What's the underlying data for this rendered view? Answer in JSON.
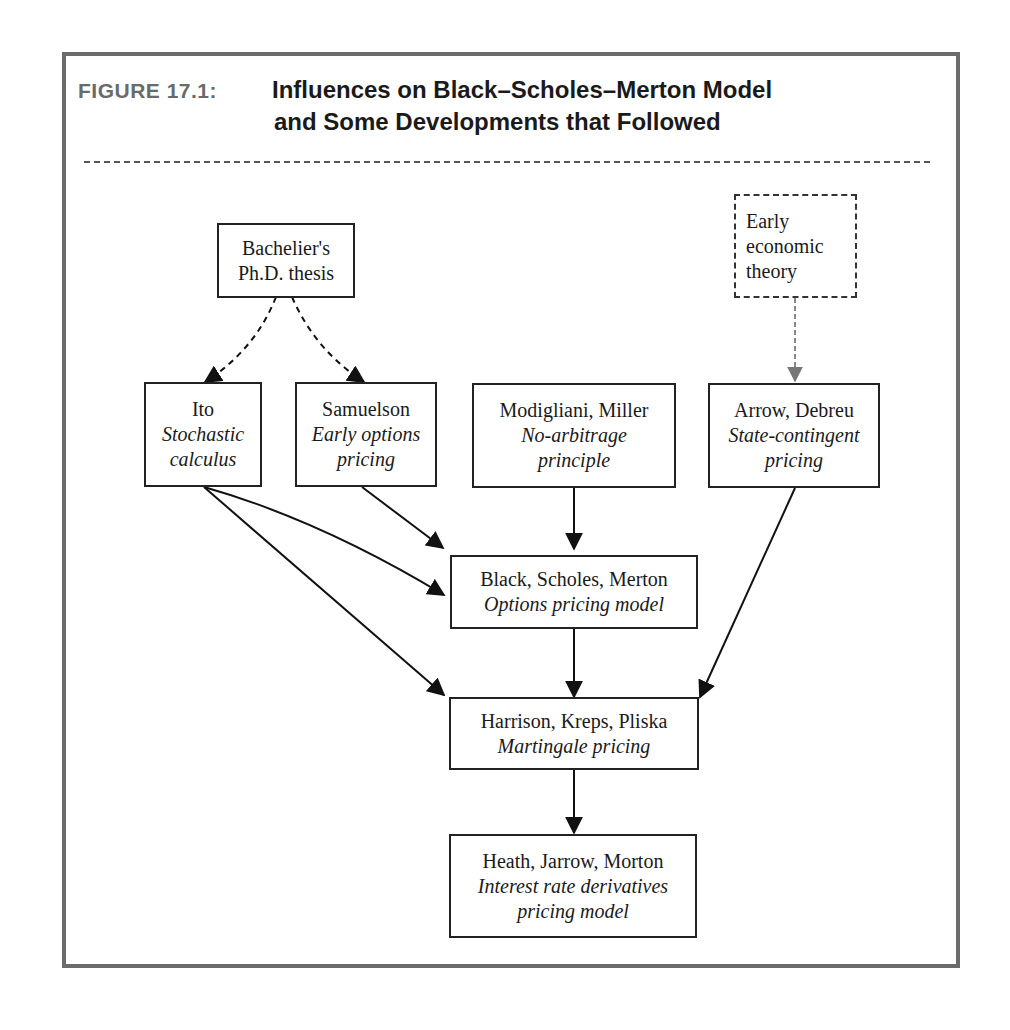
{
  "figure": {
    "label": "FIGURE 17.1:",
    "title_line1": "Influences on Black–Scholes–Merton Model",
    "title_line2": "and Some Developments that Followed"
  },
  "nodes": {
    "bachelier": {
      "name": "Bachelier's",
      "sub": "Ph.D. thesis"
    },
    "early_econ": {
      "line1": "Early",
      "line2": "economic",
      "line3": "theory"
    },
    "ito": {
      "name": "Ito",
      "sub1": "Stochastic",
      "sub2": "calculus"
    },
    "samuelson": {
      "name": "Samuelson",
      "sub1": "Early options",
      "sub2": "pricing"
    },
    "modigliani": {
      "name": "Modigliani, Miller",
      "sub1": "No-arbitrage",
      "sub2": "principle"
    },
    "arrow": {
      "name": "Arrow, Debreu",
      "sub1": "State-contingent",
      "sub2": "pricing"
    },
    "bsm": {
      "name": "Black, Scholes, Merton",
      "sub": "Options pricing model"
    },
    "hkp": {
      "name": "Harrison, Kreps, Pliska",
      "sub": "Martingale pricing"
    },
    "hjm": {
      "name": "Heath, Jarrow, Morton",
      "sub1": "Interest rate derivatives",
      "sub2": "pricing model"
    }
  },
  "edges": [
    {
      "from": "bachelier",
      "to": "ito",
      "style": "dashed"
    },
    {
      "from": "bachelier",
      "to": "samuelson",
      "style": "dashed"
    },
    {
      "from": "early_econ",
      "to": "arrow",
      "style": "dotted-gray"
    },
    {
      "from": "ito",
      "to": "bsm",
      "style": "solid"
    },
    {
      "from": "ito",
      "to": "hkp",
      "style": "solid"
    },
    {
      "from": "samuelson",
      "to": "bsm",
      "style": "solid"
    },
    {
      "from": "modigliani",
      "to": "bsm",
      "style": "solid"
    },
    {
      "from": "arrow",
      "to": "hkp",
      "style": "solid"
    },
    {
      "from": "bsm",
      "to": "hkp",
      "style": "solid"
    },
    {
      "from": "hkp",
      "to": "hjm",
      "style": "solid"
    }
  ]
}
